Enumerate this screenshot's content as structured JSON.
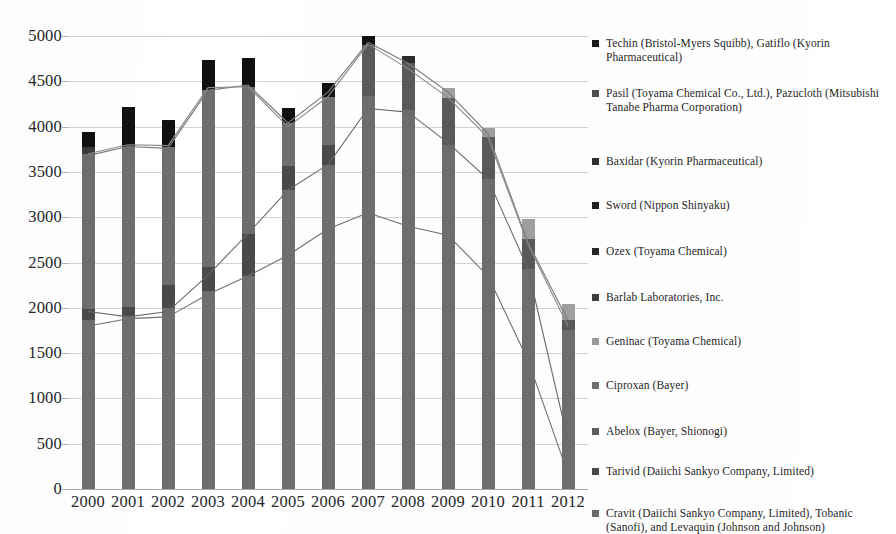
{
  "chart_data": {
    "type": "bar",
    "title": "",
    "subtitle": "",
    "xlabel": "",
    "ylabel": "",
    "ylim": [
      0,
      5000
    ],
    "ytick_step": 500,
    "grid": true,
    "legend_position": "right",
    "stacked": true,
    "overlay": "line",
    "categories": [
      "2000",
      "2001",
      "2002",
      "2003",
      "2004",
      "2005",
      "2006",
      "2007",
      "2008",
      "2009",
      "2010",
      "2011",
      "2012"
    ],
    "ytick_labels": [
      "5000",
      "4500",
      "4000",
      "3500",
      "3000",
      "2500",
      "2000",
      "1500",
      "1000",
      "500",
      "0"
    ],
    "ytick_values": [
      5000,
      4500,
      4000,
      3500,
      3000,
      2500,
      2000,
      1500,
      1000,
      500,
      0
    ],
    "totals": [
      3940,
      4220,
      4070,
      4740,
      4760,
      4210,
      4480,
      5000,
      4780,
      4430,
      3980,
      2980,
      2040
    ],
    "series": [
      {
        "name": "Techin (Bristol-Myers Squibb), Gatiflo (Kyorin Pharmaceutical)",
        "color": "#111111",
        "type": "bar-segment",
        "values": [
          250,
          420,
          300,
          300,
          300,
          180,
          200,
          70,
          40,
          0,
          0,
          0,
          0
        ]
      },
      {
        "name": "Pasil (Toyama Chemical Co., Ltd.), Pazucloth (Mitsubishi Tanabe Pharma Corporation)",
        "color": "#454545",
        "type": "bar-segment",
        "values": [
          80,
          60,
          70,
          380,
          420,
          300,
          450,
          330,
          480,
          470,
          430,
          420,
          0
        ]
      },
      {
        "name": "Baxidar (Kyorin Pharmaceutical)",
        "color": "#333333",
        "type": "bar-segment",
        "values": [
          0,
          0,
          0,
          0,
          0,
          0,
          0,
          0,
          0,
          0,
          0,
          0,
          0
        ]
      },
      {
        "name": "Sword (Nippon Shinyaku)",
        "color": "#2e2e2e",
        "type": "bar-segment",
        "values": [
          0,
          0,
          0,
          0,
          0,
          0,
          0,
          0,
          0,
          0,
          0,
          0,
          0
        ]
      },
      {
        "name": "Ozex (Toyama Chemical)",
        "color": "#3a3a3a",
        "type": "bar-segment",
        "values": [
          0,
          0,
          0,
          0,
          0,
          0,
          0,
          0,
          0,
          0,
          0,
          0,
          0
        ]
      },
      {
        "name": "Barlab Laboratories, Inc.",
        "color": "#4f4f4f",
        "type": "bar-segment",
        "values": [
          0,
          0,
          0,
          0,
          0,
          0,
          0,
          0,
          0,
          0,
          0,
          0,
          210
        ]
      },
      {
        "name": "Geninac (Toyama Chemical)",
        "color": "#8f8f8f",
        "type": "bar-segment",
        "values": [
          0,
          0,
          0,
          0,
          0,
          0,
          0,
          0,
          0,
          0,
          0,
          0,
          0
        ]
      },
      {
        "name": "Ciproxan (Bayer)",
        "color": "#707070",
        "type": "line",
        "values": [
          1800,
          1880,
          1900,
          2150,
          2350,
          2580,
          2870,
          3050,
          2900,
          2800,
          2350,
          1420,
          170
        ]
      },
      {
        "name": "Abelox (Bayer, Shionogi)",
        "color": "#6a6a6a",
        "type": "line",
        "values": [
          1960,
          1900,
          1960,
          2360,
          2820,
          3300,
          3580,
          4200,
          4160,
          3820,
          3420,
          2430,
          530
        ]
      },
      {
        "name": "Tarivid (Daiichi Sankyo Company, Limited)",
        "color": "#7a7a7a",
        "type": "line",
        "values": [
          3680,
          3780,
          3760,
          4400,
          4460,
          4040,
          4380,
          4930,
          4700,
          4380,
          3920,
          2720,
          1860
        ]
      },
      {
        "name": "Cravit (Daiichi Sankyo Company, Limited), Tobanic (Sanofi), and Levaquin (Johnson and Johnson)",
        "color": "#8a8a8a",
        "type": "line",
        "values": [
          3700,
          3800,
          3790,
          4430,
          4440,
          4000,
          4330,
          4910,
          4640,
          4320,
          3880,
          2700,
          1800
        ]
      }
    ],
    "bar_stacks": [
      {
        "category": "2000",
        "segments": [
          {
            "color": "#6e6e6e",
            "from": 0,
            "to": 1870
          },
          {
            "color": "#4a4a4a",
            "from": 1870,
            "to": 1990
          },
          {
            "color": "#6e6e6e",
            "from": 1990,
            "to": 3700
          },
          {
            "color": "#3b3b3b",
            "from": 3700,
            "to": 3770
          },
          {
            "color": "#111111",
            "from": 3770,
            "to": 3940
          }
        ]
      },
      {
        "category": "2001",
        "segments": [
          {
            "color": "#6e6e6e",
            "from": 0,
            "to": 1900
          },
          {
            "color": "#4a4a4a",
            "from": 1900,
            "to": 2010
          },
          {
            "color": "#6e6e6e",
            "from": 2010,
            "to": 3780
          },
          {
            "color": "#111111",
            "from": 3780,
            "to": 4220
          }
        ]
      },
      {
        "category": "2002",
        "segments": [
          {
            "color": "#6e6e6e",
            "from": 0,
            "to": 2000
          },
          {
            "color": "#4a4a4a",
            "from": 2000,
            "to": 2250
          },
          {
            "color": "#6e6e6e",
            "from": 2250,
            "to": 3770
          },
          {
            "color": "#111111",
            "from": 3770,
            "to": 4070
          }
        ]
      },
      {
        "category": "2003",
        "segments": [
          {
            "color": "#6e6e6e",
            "from": 0,
            "to": 2180
          },
          {
            "color": "#4a4a4a",
            "from": 2180,
            "to": 2450
          },
          {
            "color": "#6e6e6e",
            "from": 2450,
            "to": 4400
          },
          {
            "color": "#111111",
            "from": 4400,
            "to": 4740
          }
        ]
      },
      {
        "category": "2004",
        "segments": [
          {
            "color": "#6e6e6e",
            "from": 0,
            "to": 2350
          },
          {
            "color": "#4a4a4a",
            "from": 2350,
            "to": 2820
          },
          {
            "color": "#6e6e6e",
            "from": 2820,
            "to": 4440
          },
          {
            "color": "#111111",
            "from": 4440,
            "to": 4760
          }
        ]
      },
      {
        "category": "2005",
        "segments": [
          {
            "color": "#6e6e6e",
            "from": 0,
            "to": 3300
          },
          {
            "color": "#4a4a4a",
            "from": 3300,
            "to": 3560
          },
          {
            "color": "#6e6e6e",
            "from": 3560,
            "to": 4040
          },
          {
            "color": "#111111",
            "from": 4040,
            "to": 4210
          }
        ]
      },
      {
        "category": "2006",
        "segments": [
          {
            "color": "#6e6e6e",
            "from": 0,
            "to": 3580
          },
          {
            "color": "#4a4a4a",
            "from": 3580,
            "to": 3800
          },
          {
            "color": "#6e6e6e",
            "from": 3800,
            "to": 4330
          },
          {
            "color": "#111111",
            "from": 4330,
            "to": 4480
          }
        ]
      },
      {
        "category": "2007",
        "segments": [
          {
            "color": "#6e6e6e",
            "from": 0,
            "to": 4340
          },
          {
            "color": "#5a5a5a",
            "from": 4340,
            "to": 4900
          },
          {
            "color": "#111111",
            "from": 4900,
            "to": 5000
          }
        ]
      },
      {
        "category": "2008",
        "segments": [
          {
            "color": "#6e6e6e",
            "from": 0,
            "to": 4180
          },
          {
            "color": "#5a5a5a",
            "from": 4180,
            "to": 4700
          },
          {
            "color": "#2b2b2b",
            "from": 4700,
            "to": 4780
          }
        ]
      },
      {
        "category": "2009",
        "segments": [
          {
            "color": "#6e6e6e",
            "from": 0,
            "to": 3800
          },
          {
            "color": "#5a5a5a",
            "from": 3800,
            "to": 4320
          },
          {
            "color": "#a0a0a0",
            "from": 4320,
            "to": 4430
          }
        ]
      },
      {
        "category": "2010",
        "segments": [
          {
            "color": "#6e6e6e",
            "from": 0,
            "to": 3420
          },
          {
            "color": "#5a5a5a",
            "from": 3420,
            "to": 3880
          },
          {
            "color": "#a0a0a0",
            "from": 3880,
            "to": 3980
          }
        ]
      },
      {
        "category": "2011",
        "segments": [
          {
            "color": "#6e6e6e",
            "from": 0,
            "to": 2430
          },
          {
            "color": "#5a5a5a",
            "from": 2430,
            "to": 2760
          },
          {
            "color": "#a0a0a0",
            "from": 2760,
            "to": 2980
          }
        ]
      },
      {
        "category": "2012",
        "segments": [
          {
            "color": "#6e6e6e",
            "from": 0,
            "to": 1760
          },
          {
            "color": "#5a5a5a",
            "from": 1760,
            "to": 1860
          },
          {
            "color": "#a0a0a0",
            "from": 1860,
            "to": 2040
          }
        ]
      }
    ]
  },
  "legend": {
    "items": [
      {
        "label": "Techin (Bristol-Myers Squibb), Gatiflo (Kyorin Pharmaceutical)",
        "color": "#1a1a1a"
      },
      {
        "label": "Pasil (Toyama Chemical Co., Ltd.), Pazucloth (Mitsubishi Tanabe Pharma Corporation)",
        "color": "#4d4d4d"
      },
      {
        "label": "Baxidar (Kyorin Pharmaceutical)",
        "color": "#2e2e2e"
      },
      {
        "label": "Sword (Nippon Shinyaku)",
        "color": "#1f1f1f"
      },
      {
        "label": "Ozex (Toyama Chemical)",
        "color": "#262626"
      },
      {
        "label": "Barlab Laboratories, Inc.",
        "color": "#3d3d3d"
      },
      {
        "label": "Geninac (Toyama Chemical)",
        "color": "#9a9a9a"
      },
      {
        "label": "Ciproxan (Bayer)",
        "color": "#707070"
      },
      {
        "label": "Abelox (Bayer, Shionogi)",
        "color": "#5c5c5c"
      },
      {
        "label": "Tarivid (Daiichi Sankyo Company, Limited)",
        "color": "#4a4a4a"
      },
      {
        "label": "Cravit (Daiichi Sankyo Company, Limited), Tobanic (Sanofi), and Levaquin (Johnson and Johnson)",
        "color": "#6b6b6b"
      }
    ]
  }
}
